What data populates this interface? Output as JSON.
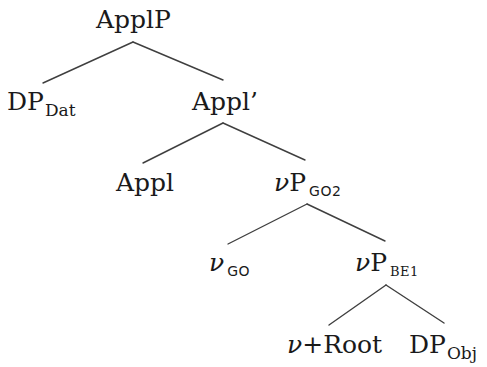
{
  "diagram": {
    "type": "syntax-tree",
    "colors": {
      "background": "#ffffff",
      "text": "#1a1a1a",
      "edge": "#3f3f3f"
    },
    "nodes": {
      "applP": {
        "main": "ApplP",
        "sub": ""
      },
      "dp_dat": {
        "main": "DP",
        "sub": "Dat"
      },
      "appl_bar": {
        "main": "Appl’",
        "sub": ""
      },
      "appl": {
        "main": "Appl",
        "sub": ""
      },
      "vp_go2": {
        "v": "ν",
        "main": "P",
        "sub": "GO2"
      },
      "v_go": {
        "v": "ν",
        "main": "",
        "sub": "GO"
      },
      "vp_be1": {
        "v": "ν",
        "main": "P",
        "sub": "BE1"
      },
      "v_root": {
        "v": "ν",
        "main": "+Root",
        "sub": ""
      },
      "dp_obj": {
        "main": "DP",
        "sub": "Obj"
      }
    },
    "edges": [
      {
        "from": "applP",
        "to": "dp_dat"
      },
      {
        "from": "applP",
        "to": "appl_bar"
      },
      {
        "from": "appl_bar",
        "to": "appl"
      },
      {
        "from": "appl_bar",
        "to": "vp_go2"
      },
      {
        "from": "vp_go2",
        "to": "v_go"
      },
      {
        "from": "vp_go2",
        "to": "vp_be1"
      },
      {
        "from": "vp_be1",
        "to": "v_root"
      },
      {
        "from": "vp_be1",
        "to": "dp_obj"
      }
    ]
  }
}
